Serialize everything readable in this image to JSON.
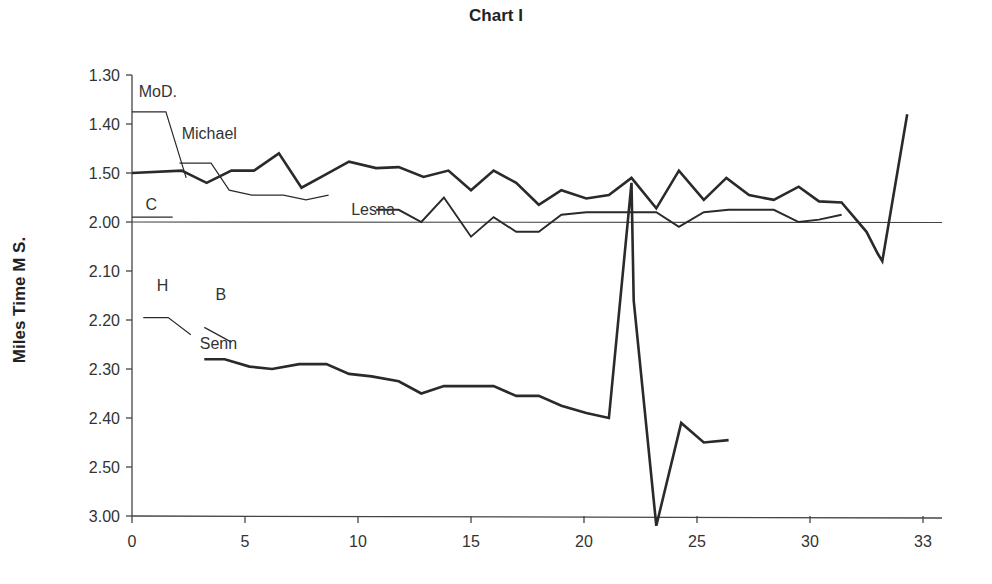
{
  "chart_data": {
    "type": "line",
    "title": "Chart I",
    "xlabel": "",
    "ylabel": "Miles Time M S.",
    "x_ticks": [
      "0",
      "5",
      "10",
      "15",
      "20",
      "25",
      "30",
      "33"
    ],
    "y_ticks": [
      "1.30",
      "1.40",
      "1.50",
      "2.00",
      "2.10",
      "2.20",
      "2.30",
      "2.40",
      "2.50",
      "3.00"
    ],
    "y_inverted": true,
    "reference_line": "2.00",
    "grid": false,
    "legend": "inline labels",
    "series": [
      {
        "name": "MoD.",
        "label_at": [
          0.3,
          0.45
        ],
        "weight": "thin",
        "points": [
          [
            0,
            0.75
          ],
          [
            1.5,
            0.75
          ],
          [
            2.4,
            2.1
          ]
        ]
      },
      {
        "name": "Michael",
        "label_at": [
          2.2,
          1.3
        ],
        "weight": "thin",
        "points": [
          [
            2.1,
            1.8
          ],
          [
            3.5,
            1.8
          ],
          [
            4.3,
            2.35
          ],
          [
            5.3,
            2.45
          ],
          [
            6.7,
            2.45
          ],
          [
            7.7,
            2.55
          ],
          [
            8.7,
            2.45
          ]
        ]
      },
      {
        "name": "C",
        "label_at": [
          0.6,
          2.75
        ],
        "weight": "thin",
        "points": [
          [
            0,
            2.9
          ],
          [
            1.8,
            2.9
          ]
        ]
      },
      {
        "name": "Main (bold)",
        "label_at": null,
        "weight": "bold",
        "points": [
          [
            0,
            2.0
          ],
          [
            2.2,
            1.95
          ],
          [
            3.3,
            2.2
          ],
          [
            4.4,
            1.95
          ],
          [
            5.4,
            1.95
          ],
          [
            6.5,
            1.6
          ],
          [
            7.5,
            2.3
          ],
          [
            8.5,
            2.05
          ],
          [
            9.6,
            1.77
          ],
          [
            10.8,
            1.9
          ],
          [
            11.8,
            1.88
          ],
          [
            12.9,
            2.08
          ],
          [
            14.0,
            1.95
          ],
          [
            15.0,
            2.35
          ],
          [
            16.0,
            1.95
          ],
          [
            17.0,
            2.2
          ],
          [
            18.0,
            2.65
          ],
          [
            19.0,
            2.35
          ],
          [
            20.1,
            2.52
          ],
          [
            21.1,
            2.45
          ],
          [
            22.1,
            2.1
          ],
          [
            23.2,
            2.72
          ],
          [
            24.2,
            1.95
          ],
          [
            25.3,
            2.55
          ],
          [
            26.3,
            2.1
          ],
          [
            27.3,
            2.45
          ],
          [
            28.4,
            2.55
          ],
          [
            29.5,
            2.28
          ],
          [
            30.4,
            2.58
          ],
          [
            31.4,
            2.6
          ],
          [
            32.5,
            3.2
          ],
          [
            33.0,
            3.65
          ],
          [
            33.2,
            3.8
          ],
          [
            34.3,
            0.8
          ]
        ]
      },
      {
        "name": "Lesna",
        "label_at": [
          9.7,
          2.85
        ],
        "weight": "thin-bold",
        "points": [
          [
            10.8,
            2.75
          ],
          [
            11.8,
            2.75
          ],
          [
            12.8,
            3.0
          ],
          [
            13.8,
            2.5
          ],
          [
            15.0,
            3.3
          ],
          [
            16.0,
            2.9
          ],
          [
            17.0,
            3.2
          ],
          [
            18.0,
            3.2
          ],
          [
            19.0,
            2.85
          ],
          [
            20.1,
            2.8
          ],
          [
            21.1,
            2.8
          ],
          [
            22.1,
            2.8
          ],
          [
            23.2,
            2.8
          ],
          [
            24.2,
            3.1
          ],
          [
            25.3,
            2.8
          ],
          [
            26.4,
            2.75
          ],
          [
            27.4,
            2.75
          ],
          [
            28.4,
            2.75
          ],
          [
            29.5,
            3.0
          ],
          [
            30.4,
            2.95
          ],
          [
            31.4,
            2.85
          ]
        ]
      },
      {
        "name": "H",
        "label_at": [
          1.1,
          4.4
        ],
        "weight": "thin",
        "points": [
          [
            0.5,
            4.95
          ],
          [
            1.6,
            4.95
          ],
          [
            2.6,
            5.3
          ]
        ]
      },
      {
        "name": "B",
        "label_at": [
          3.7,
          4.6
        ],
        "weight": "thin",
        "points": [
          [
            3.2,
            5.15
          ],
          [
            4.4,
            5.45
          ]
        ]
      },
      {
        "name": "Senn",
        "label_at": [
          3.0,
          5.6
        ],
        "weight": "bold",
        "points": [
          [
            3.2,
            5.8
          ],
          [
            4.1,
            5.8
          ],
          [
            5.2,
            5.95
          ],
          [
            6.2,
            6.0
          ],
          [
            7.4,
            5.9
          ],
          [
            8.6,
            5.9
          ],
          [
            9.6,
            6.1
          ],
          [
            10.6,
            6.15
          ],
          [
            11.8,
            6.25
          ],
          [
            12.8,
            6.5
          ],
          [
            13.8,
            6.35
          ],
          [
            15.0,
            6.35
          ],
          [
            16.0,
            6.35
          ],
          [
            17.0,
            6.55
          ],
          [
            18.0,
            6.55
          ],
          [
            19.0,
            6.75
          ],
          [
            20.1,
            6.9
          ],
          [
            21.1,
            7.0
          ],
          [
            22.1,
            2.2
          ],
          [
            22.2,
            4.6
          ],
          [
            23.2,
            9.2
          ],
          [
            24.3,
            7.1
          ],
          [
            25.3,
            7.5
          ],
          [
            26.4,
            7.45
          ]
        ]
      }
    ]
  }
}
